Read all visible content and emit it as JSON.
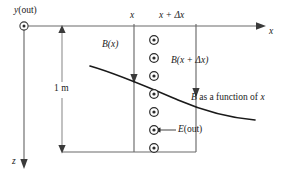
{
  "figure": {
    "kind": "physics-field-diagram",
    "colors": {
      "line": "#1a1a1a",
      "axis": "#555555",
      "background": "#ffffff",
      "curve": "#1a1a1a"
    }
  },
  "axes": {
    "y_axis_label": "y (out)",
    "y_symbol": "y",
    "y_qualifier": "(out)",
    "x_axis_label": "x",
    "z_axis_label": "z",
    "origin_marker": "dot-in-circle-icon"
  },
  "ticks": {
    "left_label": "x",
    "right_label": "x + Δx",
    "right_symbol": "x",
    "right_operator": "+",
    "right_delta": "Δx"
  },
  "dimension": {
    "label": "1 m",
    "value": "1",
    "unit": "m"
  },
  "fields": {
    "b_left_label": "B(x)",
    "b_right_label": "B(x + Δx)",
    "curve_label": "B as a function of x",
    "curve_label_symbol": "B",
    "curve_label_middle": " as a function of ",
    "curve_label_var": "x",
    "e_label": "E (out)",
    "e_symbol": "E",
    "e_qualifier": "(out)"
  },
  "field_dots": {
    "symbol": "dot-in-circle-icon",
    "count": 8,
    "meaning": "E field out of page",
    "positions_y": [
      40,
      58,
      76,
      94,
      112,
      130,
      148,
      166
    ]
  }
}
